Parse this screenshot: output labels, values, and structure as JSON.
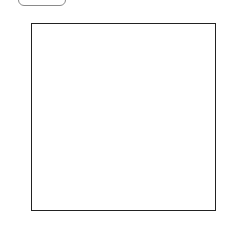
{
  "toolbar": {
    "button_label": ""
  },
  "chart_data": {
    "type": "heatmap",
    "colormap": "gray",
    "xlabel": "",
    "ylabel": "",
    "shape": [
      28,
      28
    ],
    "xlim": [
      -0.5,
      27.5
    ],
    "ylim": [
      27.5,
      -0.5
    ],
    "xticks": [
      0,
      5,
      10,
      15,
      20,
      25
    ],
    "yticks": [
      0,
      5,
      10,
      15,
      20,
      25
    ],
    "grid": false,
    "values": [
      [
        120,
        130,
        100,
        90,
        110,
        80,
        105,
        140,
        125,
        40,
        130,
        115,
        135,
        90,
        120,
        110,
        95,
        100,
        150,
        170,
        120,
        110,
        140,
        115,
        100,
        200,
        120,
        135
      ],
      [
        110,
        105,
        130,
        90,
        150,
        160,
        110,
        95,
        120,
        140,
        130,
        90,
        100,
        130,
        110,
        100,
        130,
        90,
        120,
        150,
        140,
        130,
        60,
        110,
        130,
        100,
        70,
        150
      ],
      [
        100,
        90,
        120,
        150,
        160,
        170,
        130,
        90,
        110,
        115,
        95,
        60,
        55,
        40,
        80,
        130,
        150,
        100,
        90,
        140,
        170,
        180,
        150,
        100,
        160,
        60,
        40,
        120
      ],
      [
        120,
        110,
        80,
        85,
        90,
        130,
        120,
        100,
        140,
        130,
        150,
        120,
        130,
        110,
        115,
        105,
        100,
        95,
        130,
        150,
        120,
        130,
        110,
        200,
        60,
        50,
        55,
        140
      ],
      [
        90,
        100,
        70,
        75,
        110,
        90,
        110,
        140,
        160,
        150,
        140,
        130,
        120,
        140,
        115,
        90,
        110,
        130,
        150,
        140,
        120,
        110,
        125,
        100,
        120,
        90,
        110,
        100
      ],
      [
        100,
        95,
        130,
        120,
        110,
        140,
        90,
        150,
        165,
        110,
        100,
        90,
        160,
        130,
        140,
        95,
        60,
        50,
        45,
        70,
        100,
        110,
        120,
        150,
        170,
        120,
        100,
        110
      ],
      [
        90,
        80,
        100,
        50,
        60,
        90,
        120,
        150,
        130,
        170,
        110,
        130,
        100,
        110,
        90,
        120,
        130,
        150,
        165,
        140,
        120,
        110,
        160,
        100,
        90,
        80,
        110,
        60
      ],
      [
        95,
        60,
        110,
        100,
        130,
        75,
        110,
        160,
        100,
        80,
        140,
        110,
        50,
        100,
        130,
        110,
        120,
        95,
        100,
        130,
        150,
        170,
        80,
        120,
        140,
        100,
        60,
        40
      ],
      [
        130,
        120,
        90,
        100,
        110,
        120,
        100,
        80,
        110,
        130,
        140,
        150,
        100,
        90,
        120,
        110,
        100,
        130,
        140,
        150,
        120,
        100,
        130,
        110,
        100,
        150,
        100,
        120
      ],
      [
        80,
        100,
        110,
        130,
        60,
        140,
        150,
        110,
        100,
        120,
        140,
        140,
        60,
        100,
        80,
        200,
        150,
        110,
        130,
        120,
        100,
        60,
        90,
        120,
        140,
        130,
        150,
        120
      ],
      [
        110,
        120,
        130,
        95,
        110,
        100,
        90,
        130,
        110,
        170,
        120,
        90,
        100,
        40,
        60,
        110,
        130,
        120,
        110,
        100,
        120,
        80,
        60,
        140,
        160,
        110,
        70,
        100
      ],
      [
        120,
        130,
        110,
        140,
        100,
        110,
        120,
        130,
        90,
        50,
        110,
        60,
        110,
        130,
        130,
        150,
        100,
        80,
        180,
        170,
        100,
        120,
        130,
        110,
        60,
        110,
        90,
        120
      ],
      [
        60,
        50,
        60,
        60,
        100,
        110,
        100,
        130,
        50,
        80,
        140,
        110,
        90,
        150,
        110,
        90,
        100,
        120,
        140,
        130,
        90,
        100,
        110,
        120,
        40,
        120,
        100,
        100
      ],
      [
        130,
        150,
        120,
        110,
        130,
        60,
        110,
        120,
        100,
        110,
        120,
        90,
        40,
        140,
        110,
        80,
        100,
        120,
        150,
        110,
        60,
        90,
        110,
        130,
        140,
        150,
        120,
        110
      ],
      [
        190,
        120,
        90,
        100,
        110,
        130,
        60,
        140,
        150,
        100,
        40,
        110,
        120,
        100,
        130,
        90,
        110,
        160,
        140,
        120,
        130,
        110,
        100,
        130,
        160,
        140,
        100,
        120
      ],
      [
        40,
        60,
        110,
        120,
        130,
        100,
        110,
        90,
        140,
        150,
        100,
        120,
        130,
        60,
        110,
        90,
        130,
        140,
        40,
        70,
        110,
        90,
        110,
        60,
        170,
        100,
        130,
        120
      ],
      [
        110,
        120,
        130,
        60,
        100,
        110,
        70,
        120,
        100,
        150,
        130,
        110,
        60,
        110,
        170,
        120,
        100,
        110,
        140,
        150,
        120,
        100,
        110,
        140,
        120,
        80,
        110,
        90
      ],
      [
        60,
        70,
        80,
        110,
        140,
        40,
        120,
        130,
        100,
        90,
        110,
        120,
        150,
        100,
        130,
        90,
        140,
        120,
        110,
        160,
        100,
        60,
        180,
        170,
        100,
        130,
        110,
        100
      ],
      [
        130,
        120,
        110,
        80,
        100,
        130,
        60,
        40,
        140,
        110,
        90,
        120,
        130,
        110,
        140,
        40,
        100,
        110,
        150,
        100,
        180,
        130,
        120,
        110,
        100,
        90,
        130,
        140
      ],
      [
        150,
        110,
        100,
        120,
        140,
        110,
        130,
        100,
        120,
        90,
        110,
        190,
        170,
        100,
        130,
        90,
        110,
        150,
        120,
        130,
        140,
        120,
        110,
        150,
        100,
        130,
        120,
        110
      ],
      [
        90,
        130,
        40,
        120,
        90,
        110,
        130,
        100,
        150,
        110,
        70,
        100,
        130,
        60,
        140,
        110,
        90,
        130,
        100,
        110,
        170,
        130,
        120,
        40,
        110,
        150,
        120,
        160
      ],
      [
        110,
        140,
        100,
        130,
        150,
        120,
        110,
        90,
        60,
        40,
        110,
        130,
        150,
        170,
        110,
        100,
        80,
        110,
        130,
        150,
        140,
        120,
        110,
        130,
        100,
        120,
        110,
        110
      ],
      [
        130,
        100,
        120,
        150,
        110,
        130,
        60,
        90,
        130,
        110,
        120,
        140,
        110,
        100,
        130,
        150,
        110,
        90,
        120,
        140,
        130,
        100,
        120,
        160,
        110,
        130,
        60,
        120
      ],
      [
        100,
        120,
        140,
        160,
        130,
        90,
        120,
        110,
        150,
        130,
        140,
        100,
        130,
        110,
        120,
        130,
        100,
        110,
        140,
        130,
        110,
        90,
        130,
        120,
        110,
        120,
        130,
        100
      ],
      [
        150,
        130,
        160,
        110,
        90,
        120,
        140,
        130,
        100,
        160,
        120,
        130,
        110,
        90,
        100,
        120,
        130,
        140,
        120,
        110,
        130,
        100,
        110,
        120,
        150,
        130,
        110,
        140
      ],
      [
        120,
        110,
        130,
        150,
        120,
        60,
        100,
        130,
        140,
        110,
        130,
        40,
        100,
        130,
        150,
        110,
        120,
        100,
        130,
        140,
        110,
        120,
        100,
        60,
        120,
        110,
        80,
        130
      ],
      [
        140,
        120,
        100,
        110,
        130,
        120,
        110,
        100,
        90,
        120,
        130,
        110,
        120,
        100,
        110,
        90,
        130,
        140,
        150,
        120,
        60,
        130,
        110,
        140,
        120,
        130,
        110,
        120
      ],
      [
        100,
        110,
        120,
        90,
        130,
        110,
        140,
        120,
        100,
        130,
        110,
        120,
        140,
        130,
        110,
        120,
        100,
        40,
        110,
        130,
        120,
        100,
        90,
        110,
        120,
        100,
        130,
        110
      ]
    ]
  }
}
